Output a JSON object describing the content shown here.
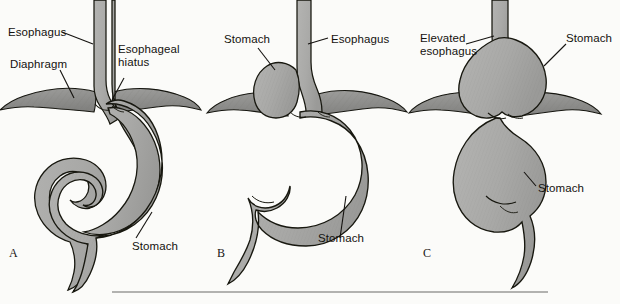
{
  "figure": {
    "background_color": "#fbfbf9",
    "organ_fill_color": "#a9a9a7",
    "organ_outline_color": "#1a1a18",
    "diaphragm_fill_color": "#8e8e8c",
    "label_text_color": "#14120f",
    "rule_color": "#6b6b69"
  },
  "panels": [
    {
      "letter": "A",
      "name": "normal-anatomy",
      "labels": [
        {
          "id": "esophagus",
          "text": "Esophagus"
        },
        {
          "id": "diaphragm",
          "text": "Diaphragm"
        },
        {
          "id": "esophageal-hiatus",
          "line1": "Esophageal",
          "line2": "hiatus"
        },
        {
          "id": "stomach",
          "text": "Stomach"
        }
      ]
    },
    {
      "letter": "B",
      "name": "paraesophageal-rolling-hernia",
      "labels": [
        {
          "id": "stomach-upper",
          "text": "Stomach"
        },
        {
          "id": "esophagus",
          "text": "Esophagus"
        },
        {
          "id": "stomach-lower",
          "text": "Stomach"
        }
      ]
    },
    {
      "letter": "C",
      "name": "sliding-hernia",
      "labels": [
        {
          "id": "elevated-esophagus",
          "line1": "Elevated",
          "line2": "esophagus"
        },
        {
          "id": "stomach-upper",
          "text": "Stomach"
        },
        {
          "id": "stomach-lower",
          "text": "Stomach"
        }
      ]
    }
  ]
}
